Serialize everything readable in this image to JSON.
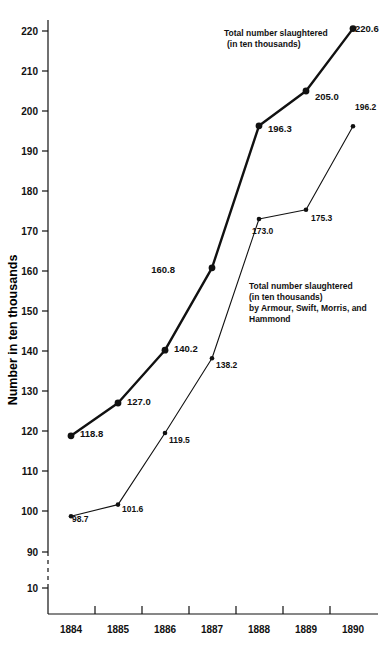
{
  "chart_data": {
    "type": "line",
    "title": "",
    "xlabel": "",
    "ylabel": "Number in ten thousands",
    "categories": [
      "1884",
      "1885",
      "1886",
      "1887",
      "1888",
      "1889",
      "1890"
    ],
    "x": [
      1884,
      1885,
      1886,
      1887,
      1888,
      1889,
      1890
    ],
    "ylim": [
      90,
      225
    ],
    "yticks": [
      220,
      210,
      200,
      190,
      180,
      170,
      160,
      150,
      140,
      130,
      120,
      110,
      100,
      90
    ],
    "ytick_labels": [
      "220",
      "210",
      "200",
      "190",
      "180",
      "170",
      "160",
      "150",
      "140",
      "130",
      "120",
      "110",
      "100",
      "90"
    ],
    "axis_break_label": "10",
    "grid": false,
    "legend_position": "inline-annotation",
    "series": [
      {
        "name": "Total number slaughtered (in ten thousands)",
        "values": [
          118.8,
          127.0,
          140.2,
          160.8,
          196.3,
          205.0,
          220.6
        ],
        "labels": [
          "118.8",
          "127.0",
          "140.2",
          "160.8",
          "196.3",
          "205.0",
          "220.6"
        ],
        "style": "thick"
      },
      {
        "name": "Total number slaughtered (in ten thousands) by Armour, Swift, Morris, and Hammond",
        "values": [
          98.7,
          101.6,
          119.5,
          138.2,
          173.0,
          175.3,
          196.2
        ],
        "labels": [
          "98.7",
          "101.6",
          "119.5",
          "138.2",
          "173.0",
          "175.3",
          "196.2"
        ],
        "style": "thin"
      }
    ],
    "annotations": [
      {
        "id": "annotation-total",
        "lines": [
          "Total number  slaughtered",
          "(in ten thousands)"
        ]
      },
      {
        "id": "annotation-big-four",
        "lines": [
          "Total number slaughtered",
          "(in ten thousands)",
          "by Armour, Swift, Morris, and",
          "Hammond"
        ]
      }
    ],
    "colors": {
      "line": "#111111",
      "text": "#111111",
      "background": "#ffffff"
    }
  }
}
